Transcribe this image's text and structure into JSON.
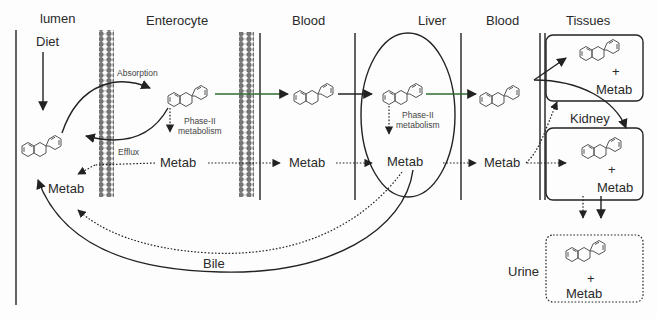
{
  "compartments": {
    "lumen": "lumen",
    "enterocyte": "Enterocyte",
    "blood1": "Blood",
    "liver": "Liver",
    "blood2": "Blood",
    "tissues": "Tissues",
    "kidney": "Kidney",
    "urine": "Urine"
  },
  "labels": {
    "diet": "Diet",
    "absorption": "Absorption",
    "efflux": "Efflux",
    "phase2_entero_l1": "Phase-II",
    "phase2_entero_l2": "metabolism",
    "phase2_liver_l1": "Phase-II",
    "phase2_liver_l2": "metabolism",
    "bile": "Bile",
    "plus": "+",
    "metab": "Metab"
  },
  "metab_nodes": {
    "lumen": "Metab",
    "enterocyte": "Metab",
    "blood1": "Metab",
    "liver": "Metab",
    "blood2": "Metab",
    "tissues": "Metab",
    "kidney": "Metab",
    "urine": "Metab"
  },
  "colors": {
    "line": "#222222",
    "transport_arrow": "#2e6b2e",
    "molecule": "#555555",
    "membrane": "#777777"
  }
}
